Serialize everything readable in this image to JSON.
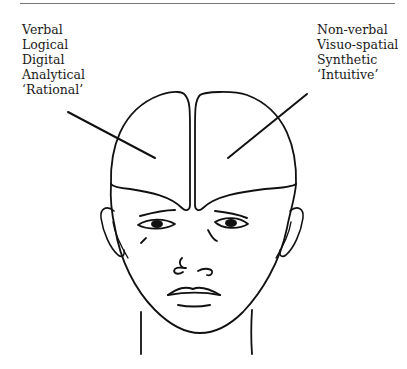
{
  "figure": {
    "left_hemisphere_labels": [
      "Verbal",
      "Logical",
      "Digital",
      "Analytical",
      "‘Rational’"
    ],
    "right_hemisphere_labels": [
      "Non-verbal",
      "Visuo-spatial",
      "Synthetic",
      "‘Intuitive’"
    ]
  }
}
